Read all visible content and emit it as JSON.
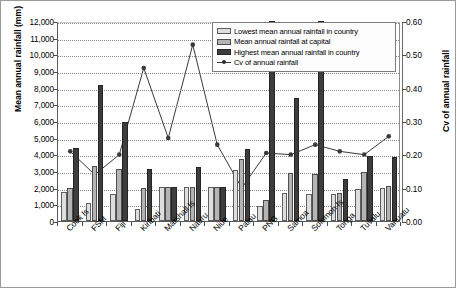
{
  "chart_data": {
    "type": "bar",
    "title": "",
    "xlabel": "",
    "ylabel": "Mean annual rainfall (mm)",
    "y2label": "Cv of annual rainfall",
    "ylim": [
      0,
      12000
    ],
    "ytick_step": 1000,
    "y2lim": [
      0,
      0.6
    ],
    "y2tick_step": 0.1,
    "grid": "horizontal-dotted",
    "legend_position": "top-right-inside",
    "categories": [
      "Cook Is",
      "FSM",
      "Fiji",
      "Kiribati",
      "Marshall Is",
      "Nauru",
      "Niue",
      "Palau",
      "PNG",
      "Samoa",
      "Solomon Is",
      "Tonga",
      "Tuvalu",
      "Vanuatu"
    ],
    "yticks": [
      "0",
      "1,000",
      "2,000",
      "3,000",
      "4,000",
      "5,000",
      "6,000",
      "7,000",
      "8,000",
      "9,000",
      "10,000",
      "11,000",
      "12,000"
    ],
    "y2ticks": [
      "0.00",
      "0.10",
      "0.20",
      "0.30",
      "0.40",
      "0.50",
      "0.60"
    ],
    "series": [
      {
        "name": "Lowest mean annual rainfall in country",
        "type": "bar",
        "color": "#dedede",
        "axis": "left",
        "values": [
          1750,
          1100,
          1650,
          700,
          2050,
          2050,
          2050,
          3050,
          900,
          1700,
          1600,
          1650,
          1950,
          2000
        ]
      },
      {
        "name": "Mean annual rainfall at capital",
        "type": "bar",
        "color": "#b4b4b4",
        "axis": "left",
        "values": [
          2000,
          3300,
          3100,
          2000,
          2050,
          2050,
          2050,
          3750,
          1250,
          2900,
          2850,
          1700,
          2950,
          2100
        ]
      },
      {
        "name": "Highest mean annual rainfall in country",
        "type": "bar",
        "color": "#3d3d3d",
        "axis": "left",
        "values": [
          4400,
          8150,
          5950,
          3100,
          2050,
          3250,
          2050,
          4300,
          12000,
          7400,
          12000,
          2500,
          3900,
          3850
        ]
      },
      {
        "name": "Cv of annual rainfall",
        "type": "line",
        "color": "#3a3a3a",
        "axis": "right",
        "values": [
          0.215,
          0.145,
          0.205,
          0.465,
          0.255,
          0.535,
          0.235,
          0.105,
          0.21,
          0.205,
          0.235,
          0.215,
          0.205,
          0.26
        ]
      }
    ]
  },
  "legend": {
    "items": [
      "Lowest mean annual rainfall in country",
      "Mean annual rainfall at capital",
      "Highest mean annual rainfall in country",
      "Cv of annual rainfall"
    ]
  }
}
